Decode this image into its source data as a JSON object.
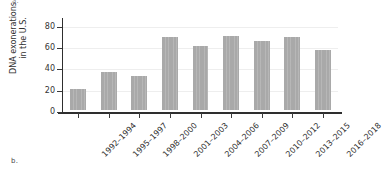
{
  "figure": {
    "panel_label_top": "a.",
    "panel_label_bottom": "b."
  },
  "colors": {
    "bar_fill": "#a9a9a9",
    "axis": "#2e2e2e",
    "gridline": "#eeeeee",
    "text": "#2f2f2f"
  },
  "chart_data": {
    "type": "bar",
    "title": "",
    "xlabel": "",
    "ylabel": "DNA exonerations in the U.S.",
    "ylabel_lines": [
      "DNA exonerations",
      "in the U.S."
    ],
    "categories": [
      "1992–1994",
      "1995–1997",
      "1998–2000",
      "2001–2003",
      "2004–2006",
      "2007–2009",
      "2010–2012",
      "2013–2015",
      "2016–2018"
    ],
    "values": [
      20,
      36,
      32,
      68,
      60,
      69,
      65,
      68,
      56
    ],
    "ylim": [
      0,
      88
    ],
    "yticks": [
      0,
      20,
      40,
      60,
      80
    ],
    "ytick_labels": [
      "0",
      "20",
      "40",
      "60",
      "80"
    ],
    "grid": true,
    "grid_axis": "y",
    "legend": false
  }
}
